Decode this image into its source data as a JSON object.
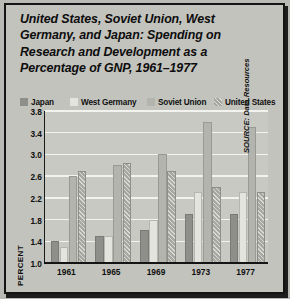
{
  "title": {
    "lines": [
      "United States, Soviet Union, West",
      "Germany, and Japan: Spending on",
      "Research and Development as a",
      "Percentage of GNP, 1961–1977"
    ]
  },
  "source_note": "SOURCE: Data Resources",
  "colors": {
    "background": "#c3c3bd",
    "plot_background": "#c9c9c3",
    "gridline": "#f2f2ee",
    "axis": "#141414",
    "japan": "#8e8e8a",
    "west_germany": "#e4e4de",
    "soviet_union": "#b4b4ae",
    "united_states": "#a8a8a2"
  },
  "chart_data": {
    "type": "bar",
    "title": "United States, Soviet Union, West Germany, and Japan: Spending on Research and Development as a Percentage of GNP, 1961–1977",
    "xlabel": "",
    "ylabel": "PERCENT",
    "categories": [
      "1961",
      "1965",
      "1969",
      "1973",
      "1977"
    ],
    "ylim": [
      1.0,
      3.8
    ],
    "yticks": [
      "1.0",
      "1.4",
      "1.8",
      "2.2",
      "2.6",
      "3.0",
      "3.4",
      "3.8"
    ],
    "ytick_values": [
      1.0,
      1.4,
      1.8,
      2.2,
      2.6,
      3.0,
      3.4,
      3.8
    ],
    "grid": true,
    "legend_position": "top",
    "series": [
      {
        "name": "Japan",
        "values": [
          1.4,
          1.5,
          1.6,
          1.9,
          1.9
        ]
      },
      {
        "name": "West Germany",
        "values": [
          1.3,
          1.5,
          1.8,
          2.3,
          2.3
        ]
      },
      {
        "name": "Soviet Union",
        "values": [
          2.6,
          2.8,
          3.0,
          3.6,
          3.5
        ]
      },
      {
        "name": "United States",
        "values": [
          2.7,
          2.85,
          2.7,
          2.4,
          2.3
        ]
      }
    ]
  },
  "legend": {
    "items": [
      {
        "label": "Japan",
        "color": "#8e8e8a"
      },
      {
        "label": "West Germany",
        "color": "#e4e4de"
      },
      {
        "label": "Soviet Union",
        "color": "#b4b4ae"
      },
      {
        "label": "United States",
        "color": "#a8a8a2"
      }
    ]
  }
}
